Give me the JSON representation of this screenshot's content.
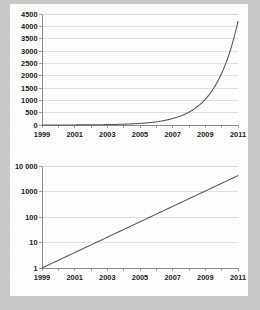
{
  "figures": [
    {
      "id": "linear-chart",
      "name": "exponential-growth-linear-scale",
      "chart_data": {
        "type": "line",
        "title": "",
        "xlabel": "",
        "ylabel": "",
        "scale_y": "linear",
        "grid": true,
        "legend": "none",
        "xlim": [
          1999,
          2011
        ],
        "ylim": [
          0,
          4500
        ],
        "x_ticks_all": [
          1999,
          2000,
          2001,
          2002,
          2003,
          2004,
          2005,
          2006,
          2007,
          2008,
          2009,
          2010,
          2011
        ],
        "x_tick_labels": [
          "1999",
          "2001",
          "2003",
          "2005",
          "2007",
          "2009",
          "2011"
        ],
        "x_tick_label_values": [
          1999,
          2001,
          2003,
          2005,
          2007,
          2009,
          2011
        ],
        "y_tick_labels": [
          "0",
          "500",
          "1000",
          "1500",
          "2000",
          "2500",
          "3000",
          "3500",
          "4000",
          "4500"
        ],
        "y_tick_values": [
          0,
          500,
          1000,
          1500,
          2000,
          2500,
          3000,
          3500,
          4000,
          4500
        ],
        "series": [
          {
            "name": "growth",
            "color": "#555555",
            "x": [
              1999,
              2000,
              2001,
              2002,
              2003,
              2004,
              2005,
              2006,
              2007,
              2008,
              2009,
              2010,
              2011
            ],
            "values": [
              1,
              2.3,
              5.5,
              13,
              30,
              71,
              168,
              398,
              943,
              1000,
              1500,
              2400,
              4200
            ]
          }
        ]
      }
    },
    {
      "id": "log-chart",
      "name": "exponential-growth-log-scale",
      "chart_data": {
        "type": "line",
        "title": "",
        "xlabel": "",
        "ylabel": "",
        "scale_y": "log",
        "grid": true,
        "legend": "none",
        "xlim": [
          1999,
          2011
        ],
        "ylim": [
          1,
          10000
        ],
        "x_ticks_all": [
          1999,
          2000,
          2001,
          2002,
          2003,
          2004,
          2005,
          2006,
          2007,
          2008,
          2009,
          2010,
          2011
        ],
        "x_tick_labels": [
          "1999",
          "2001",
          "2003",
          "2005",
          "2007",
          "2009",
          "2011"
        ],
        "x_tick_label_values": [
          1999,
          2001,
          2003,
          2005,
          2007,
          2009,
          2011
        ],
        "y_tick_labels": [
          "1",
          "10",
          "100",
          "1000",
          "10 000"
        ],
        "y_tick_values": [
          1,
          10,
          100,
          1000,
          10000
        ],
        "series": [
          {
            "name": "growth",
            "color": "#555555",
            "x": [
              1999,
              2000,
              2001,
              2002,
              2003,
              2004,
              2005,
              2006,
              2007,
              2008,
              2009,
              2010,
              2011
            ],
            "values": [
              1,
              2.1,
              4.4,
              9.3,
              19.5,
              41,
              86,
              180,
              378,
              794,
              1000,
              2000,
              4200
            ]
          }
        ]
      }
    }
  ],
  "colors": {
    "background": "#c9c9c9",
    "paper": "#fdfdfd",
    "series": "#555555",
    "gridline": "#d8d8d8",
    "axis": "#7d7d7d",
    "text": "#1a1a1a"
  }
}
